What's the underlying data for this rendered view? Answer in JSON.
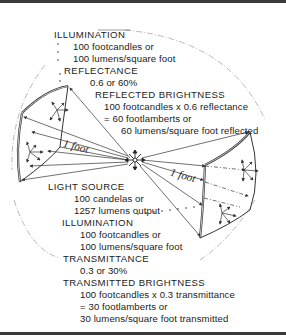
{
  "diagram": {
    "illumination_top": {
      "heading": "ILLUMINATION",
      "line1": "100 footcandles or",
      "line2": "100 lumens/square foot"
    },
    "reflectance": {
      "heading": "REFLECTANCE",
      "value": "0.6 or 60%"
    },
    "reflected_brightness": {
      "heading": "REFLECTED BRIGHTNESS",
      "line1": "100 footcandles x 0.6 reflectance",
      "line2": "= 60 footlamberts or",
      "line3": "60 lumens/square foot reflected"
    },
    "distance_left": "1 foot",
    "distance_right": "1 foot",
    "light_source": {
      "heading": "LIGHT SOURCE",
      "line1": "100 candelas or",
      "line2": "1257 lumens output"
    },
    "illumination_bottom": {
      "heading": "ILLUMINATION",
      "line1": "100 footcandles or",
      "line2": "100 lumens/square foot"
    },
    "transmittance": {
      "heading": "TRANSMITTANCE",
      "value": "0.3 or 30%"
    },
    "transmitted_brightness": {
      "heading": "TRANSMITTED BRIGHTNESS",
      "line1": "100 footcandles x 0.3 transmittance",
      "line2": "= 30 footlamberts or",
      "line3": "30 lumens/square foot transmitted"
    },
    "colors": {
      "line": "#333333",
      "background": "#ffffff",
      "frame": "#3a3a3a"
    }
  }
}
